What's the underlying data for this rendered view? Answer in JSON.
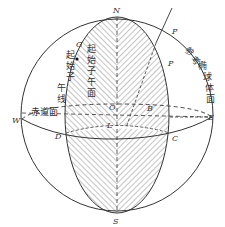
{
  "diagram": {
    "title": "",
    "colors": {
      "stroke": "#333333",
      "hatch": "#555555",
      "background": "#ffffff"
    },
    "points": {
      "N": "N",
      "S": "S",
      "W": "W",
      "E": "E",
      "O": "O",
      "L": "L",
      "B": "B",
      "G": "G",
      "D": "D",
      "C": "C",
      "P_outer": "P",
      "P_inner": "P"
    },
    "labels": {
      "prime_meridian_plane": [
        "起",
        "始",
        "子",
        "午",
        "面"
      ],
      "prime_meridian_line": [
        "起",
        "始",
        "子",
        "午",
        "线"
      ],
      "equator_plane": "赤道面",
      "reference_ellipsoid": [
        "参",
        "考",
        "椭",
        "球",
        "体",
        "面"
      ]
    }
  }
}
